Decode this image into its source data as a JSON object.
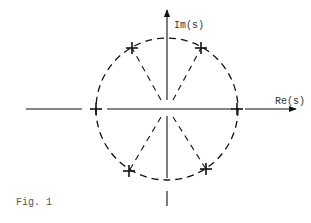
{
  "figure": {
    "caption": "Fig. 1",
    "axes": {
      "imag_label": "Im(s)",
      "real_label": "Re(s)"
    },
    "center": {
      "x": 167,
      "y": 108
    },
    "circle": {
      "radius": 71,
      "style": "dashed"
    },
    "poles": [
      {
        "label": "pole-upper-left",
        "x": 132,
        "y": 48
      },
      {
        "label": "pole-upper-right",
        "x": 201,
        "y": 48
      },
      {
        "label": "pole-left",
        "x": 96,
        "y": 109
      },
      {
        "label": "pole-right",
        "x": 237,
        "y": 109
      },
      {
        "label": "pole-lower-left",
        "x": 129,
        "y": 171
      },
      {
        "label": "pole-lower-right",
        "x": 206,
        "y": 169
      }
    ],
    "marker": "+",
    "colors": {
      "ink": "#111111",
      "background": "#ffffff"
    }
  }
}
